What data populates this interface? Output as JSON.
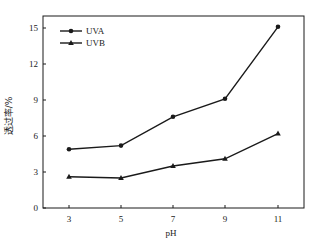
{
  "chart_data": {
    "type": "line",
    "title": "",
    "xlabel": "pH",
    "ylabel": "透过率/%",
    "x": [
      3,
      5,
      7,
      9,
      11
    ],
    "x_ticks": [
      3,
      5,
      7,
      9,
      11
    ],
    "y_ticks": [
      0,
      3,
      6,
      9,
      12,
      15
    ],
    "xlim": [
      1.7,
      12.3
    ],
    "ylim": [
      0,
      16
    ],
    "grid": false,
    "legend_position": "upper left",
    "series": [
      {
        "name": "UVA",
        "marker": "circle",
        "values": [
          4.9,
          5.2,
          7.6,
          9.1,
          15.1
        ]
      },
      {
        "name": "UVB",
        "marker": "triangle",
        "values": [
          2.6,
          2.5,
          3.5,
          4.1,
          6.2
        ]
      }
    ]
  },
  "colors": {
    "line": "#1a1a1a",
    "axis": "#1a1a1a",
    "background": "#ffffff"
  }
}
